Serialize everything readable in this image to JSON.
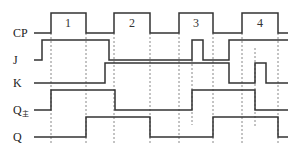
{
  "diagram": {
    "type": "timing-diagram",
    "signals": [
      {
        "name": "CP",
        "label": "CP",
        "sub": "",
        "y_low": 33,
        "y_high": 13,
        "label_y": 37,
        "points": [
          [
            34,
            "L"
          ],
          [
            51,
            "H"
          ],
          [
            86,
            "L"
          ],
          [
            114,
            "H"
          ],
          [
            150,
            "L"
          ],
          [
            179,
            "H"
          ],
          [
            213,
            "L"
          ],
          [
            242,
            "H"
          ],
          [
            278,
            "L"
          ],
          [
            288,
            "L"
          ]
        ]
      },
      {
        "name": "J",
        "label": "J",
        "sub": "",
        "y_low": 60,
        "y_high": 40,
        "label_y": 64,
        "points": [
          [
            34,
            "L"
          ],
          [
            42,
            "H"
          ],
          [
            109,
            "L"
          ],
          [
            192,
            "H"
          ],
          [
            203,
            "L"
          ],
          [
            229,
            "H"
          ],
          [
            288,
            "H"
          ]
        ]
      },
      {
        "name": "K",
        "label": "K",
        "sub": "",
        "y_low": 83,
        "y_high": 63,
        "label_y": 87,
        "points": [
          [
            34,
            "L"
          ],
          [
            105,
            "H"
          ],
          [
            229,
            "L"
          ],
          [
            255,
            "H"
          ],
          [
            266,
            "L"
          ],
          [
            288,
            "L"
          ]
        ]
      },
      {
        "name": "Q-master",
        "label": "Q",
        "sub": "主",
        "y_low": 110,
        "y_high": 90,
        "label_y": 114,
        "points": [
          [
            34,
            "L"
          ],
          [
            51,
            "H"
          ],
          [
            115,
            "L"
          ],
          [
            192,
            "H"
          ],
          [
            255,
            "L"
          ],
          [
            288,
            "L"
          ]
        ]
      },
      {
        "name": "Q",
        "label": "Q",
        "sub": "",
        "y_low": 137,
        "y_high": 117,
        "label_y": 141,
        "points": [
          [
            34,
            "L"
          ],
          [
            86,
            "H"
          ],
          [
            150,
            "L"
          ],
          [
            213,
            "H"
          ],
          [
            278,
            "L"
          ],
          [
            288,
            "L"
          ]
        ]
      }
    ],
    "clock_pulses": [
      {
        "label": "1",
        "x": 68
      },
      {
        "label": "2",
        "x": 132
      },
      {
        "label": "3",
        "x": 196
      },
      {
        "label": "4",
        "x": 260
      }
    ],
    "dashed_lines": [
      {
        "x": 51,
        "y1": 33,
        "y2": 145
      },
      {
        "x": 86,
        "y1": 33,
        "y2": 145
      },
      {
        "x": 114,
        "y1": 33,
        "y2": 145
      },
      {
        "x": 150,
        "y1": 33,
        "y2": 145
      },
      {
        "x": 179,
        "y1": 33,
        "y2": 145
      },
      {
        "x": 192,
        "y1": 60,
        "y2": 125
      },
      {
        "x": 213,
        "y1": 33,
        "y2": 145
      },
      {
        "x": 242,
        "y1": 33,
        "y2": 145
      },
      {
        "x": 255,
        "y1": 48,
        "y2": 127
      },
      {
        "x": 278,
        "y1": 33,
        "y2": 145
      }
    ],
    "colors": {
      "line": "#333333",
      "dash": "#888888",
      "text": "#222222"
    }
  }
}
